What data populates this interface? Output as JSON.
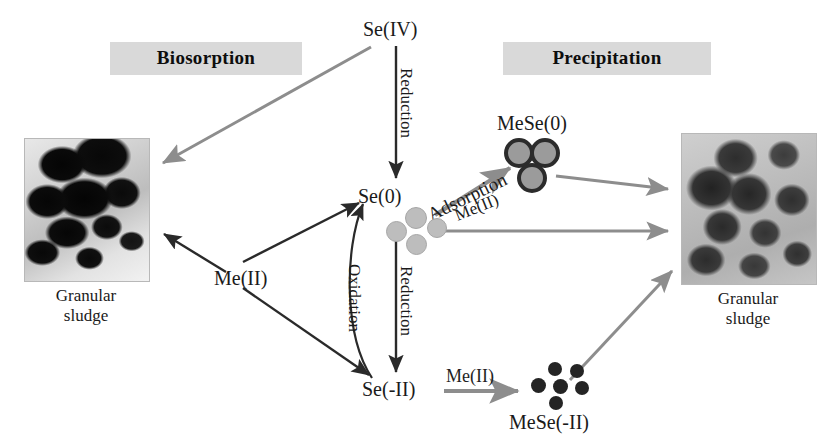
{
  "figure": {
    "background_color": "#ffffff"
  },
  "banners": {
    "left": "Biosorption",
    "right": "Precipitation",
    "background_color": "#d9d9d9",
    "text_color": "#0d0d0d"
  },
  "species": {
    "se_iv": "Se(IV)",
    "se_0": "Se(0)",
    "se_minus_ii": "Se(-II)",
    "mese_0": "MeSe(0)",
    "mese_minus_ii": "MeSe(-II)",
    "me_ii_left": "Me(II)",
    "me_ii_adsorption": "Me(II)",
    "me_ii_bottom": "Me(II)"
  },
  "processes": {
    "reduction_top": "Reduction",
    "reduction_bottom": "Reduction",
    "oxidation": "Oxidation",
    "adsorption": "Adsorption"
  },
  "micrographs": {
    "left": {
      "caption_line1": "Granular",
      "caption_line2": "sludge",
      "appearance": "dark-electron-micrograph"
    },
    "right": {
      "caption_line1": "Granular",
      "caption_line2": "sludge",
      "appearance": "gray-aggregate-micrograph"
    }
  },
  "particle_clusters": {
    "se0_colloids": {
      "count": 4,
      "color": "#bdbdbd",
      "style": "gray-spheres"
    },
    "mese0_spheres": {
      "count": 3,
      "color": "#9b9b9b",
      "ring_color": "#2b2b2b",
      "style": "ringed-spheres"
    },
    "meseii_dots": {
      "count": 6,
      "color": "#242424",
      "style": "solid-dark-dots"
    }
  },
  "arrows": {
    "se_iv_to_left_sludge": "biosorption of Se(IV) onto granular sludge",
    "se_iv_to_se_0": "Reduction",
    "se_0_to_se_minus_ii": "Reduction",
    "se_minus_ii_to_se_0": "Oxidation",
    "me_ii_to_left_sludge": "metal biosorption",
    "me_ii_to_se_0": "metal to elemental selenium",
    "me_ii_to_se_minus_ii": "metal to selenide",
    "se_0_to_mese_0": "Adsorption with Me(II)",
    "mese_0_to_right_sludge": "precipitate retained in sludge",
    "se_0_colloids_to_right_sludge": "colloidal Se(0) retained in sludge",
    "se_minus_ii_to_mese_minus_ii": "Me(II) precipitation",
    "mese_minus_ii_to_right_sludge": "metal selenide retained in sludge"
  },
  "colors": {
    "arrow_dark": "#2a2a2a",
    "arrow_gray": "#8d8d8d",
    "text": "#1a1a1a",
    "banner_fill": "#d9d9d9"
  }
}
